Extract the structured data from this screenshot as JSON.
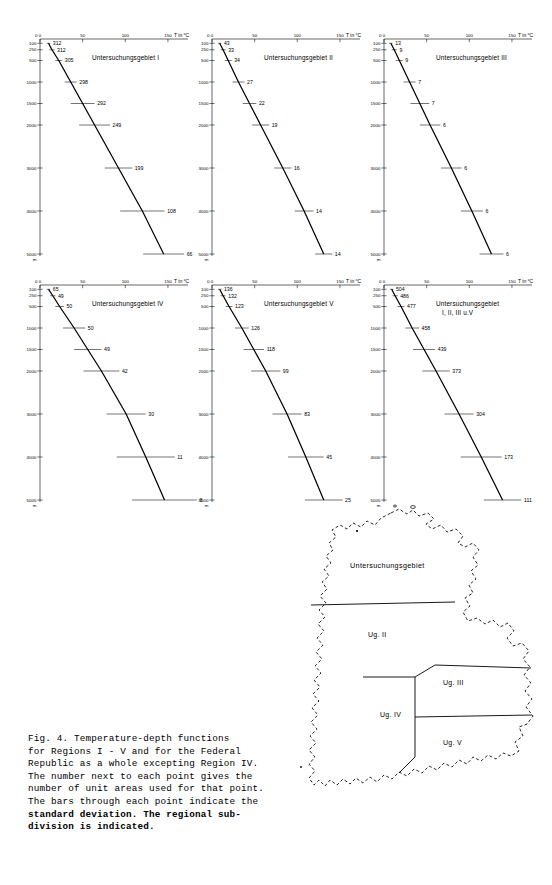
{
  "figure": {
    "caption_lines": [
      "Fig. 4. Temperature-depth functions",
      "for Regions I - V and for the Federal",
      "Republic as a whole excepting Region IV.",
      "The number next to each point gives the",
      "number of unit areas used for that point.",
      "The bars through each point indicate the",
      "standard deviation. The regional sub-",
      "division is indicated."
    ]
  },
  "axes": {
    "x_label": "T in °C",
    "x_ticks": [
      0,
      50,
      100,
      150
    ],
    "x_min": 0,
    "x_max": 170,
    "y_label": "m",
    "y_ticks": [
      100,
      250,
      500,
      1000,
      1500,
      2000,
      3000,
      4000,
      5000
    ],
    "y_tick_labels": [
      "100",
      "250",
      "500",
      "1000",
      "1500",
      "2000",
      "3000",
      "4000",
      "5000"
    ],
    "y_min": 0,
    "y_max": 5000,
    "y_unit": "m",
    "zero_label": "0"
  },
  "chart_data": [
    {
      "type": "line",
      "id": "region-1",
      "title": "Untersuchungsgebiet I",
      "xlabel": "T in °C",
      "ylabel": "m",
      "xlim": [
        0,
        170
      ],
      "ylim": [
        0,
        5000
      ],
      "depths": [
        100,
        250,
        500,
        1000,
        1500,
        2000,
        3000,
        4000,
        5000
      ],
      "temperatures": [
        10,
        14,
        22,
        36,
        50,
        64,
        92,
        120,
        145
      ],
      "counts": [
        312,
        312,
        305,
        298,
        292,
        249,
        199,
        108,
        66
      ],
      "errors": [
        2,
        3,
        4,
        7,
        14,
        18,
        16,
        26,
        24
      ]
    },
    {
      "type": "line",
      "id": "region-2",
      "title": "Untersuchungsgebiet II",
      "xlabel": "T in °C",
      "ylabel": "m",
      "xlim": [
        0,
        170
      ],
      "ylim": [
        0,
        5000
      ],
      "depths": [
        100,
        250,
        500,
        1000,
        1500,
        2000,
        3000,
        4000,
        5000
      ],
      "temperatures": [
        9,
        13,
        19,
        31,
        44,
        57,
        83,
        108,
        131
      ],
      "counts": [
        43,
        33,
        34,
        27,
        22,
        19,
        16,
        14,
        14
      ],
      "errors": [
        2,
        3,
        4,
        7,
        8,
        10,
        10,
        11,
        10
      ]
    },
    {
      "type": "line",
      "id": "region-3",
      "title": "Untersuchungsgebiet III",
      "xlabel": "T in °C",
      "ylabel": "m",
      "xlim": [
        0,
        170
      ],
      "ylim": [
        0,
        5000
      ],
      "depths": [
        100,
        250,
        500,
        1000,
        1500,
        2000,
        3000,
        4000,
        5000
      ],
      "temperatures": [
        8,
        12,
        18,
        30,
        42,
        54,
        79,
        103,
        126
      ],
      "counts": [
        13,
        9,
        9,
        7,
        7,
        6,
        6,
        6,
        6
      ],
      "errors": [
        2,
        3,
        4,
        7,
        11,
        12,
        12,
        13,
        14
      ]
    },
    {
      "type": "line",
      "id": "region-4",
      "title": "Untersuchungsgebiet IV",
      "xlabel": "T in °C",
      "ylabel": "m",
      "xlim": [
        0,
        170
      ],
      "ylim": [
        0,
        5000
      ],
      "depths": [
        100,
        250,
        500,
        1000,
        1500,
        2000,
        3000,
        4000,
        5000
      ],
      "temperatures": [
        10,
        15,
        23,
        40,
        56,
        72,
        101,
        124,
        146
      ],
      "counts": [
        65,
        49,
        50,
        50,
        49,
        42,
        30,
        11,
        8
      ],
      "errors": [
        2,
        3,
        5,
        13,
        16,
        21,
        23,
        34,
        38
      ]
    },
    {
      "type": "line",
      "id": "region-5",
      "title": "Untersuchungsgebiet V",
      "xlabel": "T in °C",
      "ylabel": "m",
      "xlim": [
        0,
        170
      ],
      "ylim": [
        0,
        5000
      ],
      "depths": [
        100,
        250,
        500,
        1000,
        1500,
        2000,
        3000,
        4000,
        5000
      ],
      "temperatures": [
        9,
        13,
        20,
        35,
        49,
        63,
        88,
        110,
        131
      ],
      "counts": [
        136,
        132,
        123,
        126,
        118,
        99,
        83,
        45,
        25
      ],
      "errors": [
        2,
        3,
        4,
        8,
        12,
        17,
        17,
        21,
        22
      ]
    },
    {
      "type": "line",
      "id": "regions-combined",
      "title": "Untersuchungsgebiet",
      "title2": "I, II, III u.V",
      "xlabel": "T in °C",
      "ylabel": "m",
      "xlim": [
        0,
        170
      ],
      "ylim": [
        0,
        5000
      ],
      "depths": [
        100,
        250,
        500,
        1000,
        1500,
        2000,
        3000,
        4000,
        5000
      ],
      "temperatures": [
        9,
        13,
        20,
        33,
        47,
        61,
        88,
        114,
        139
      ],
      "counts": [
        504,
        486,
        477,
        458,
        439,
        373,
        304,
        173,
        111
      ],
      "errors": [
        2,
        3,
        4,
        8,
        13,
        16,
        17,
        24,
        22
      ]
    }
  ],
  "map": {
    "labels": [
      {
        "text": "Untersuchungsgebiet",
        "x": 55,
        "y": 63
      },
      {
        "text": "Ug. II",
        "x": 73,
        "y": 132
      },
      {
        "text": "Ug. III",
        "x": 148,
        "y": 180
      },
      {
        "text": "Ug. IV",
        "x": 85,
        "y": 212
      },
      {
        "text": "Ug. V",
        "x": 148,
        "y": 240
      }
    ]
  }
}
